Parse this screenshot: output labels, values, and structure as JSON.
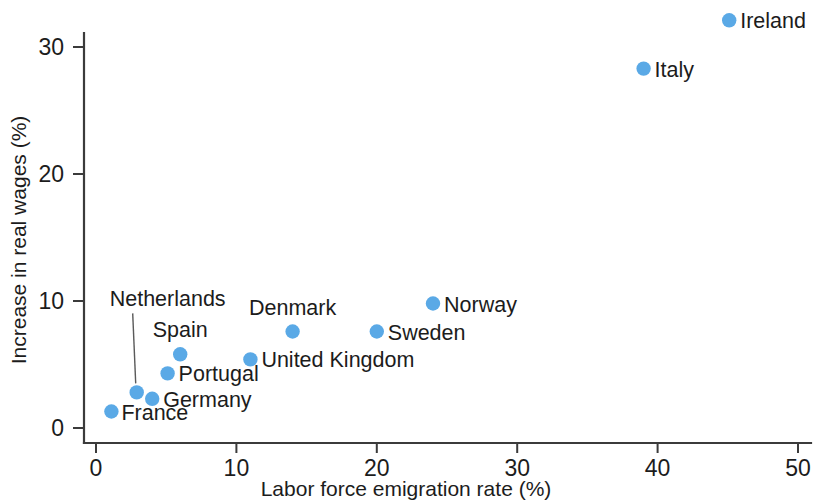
{
  "chart_data": {
    "type": "scatter",
    "title": "",
    "xlabel": "Labor force emigration rate (%)",
    "ylabel": "Increase in real wages (%)",
    "xlim": [
      0,
      50
    ],
    "ylim": [
      0,
      33.7
    ],
    "xticks": [
      0,
      10,
      20,
      30,
      40,
      50
    ],
    "yticks": [
      0,
      10,
      20,
      30
    ],
    "xtick_labels": [
      "0",
      "10",
      "20",
      "30",
      "40",
      "50"
    ],
    "ytick_labels": [
      "0",
      "10",
      "20",
      "30"
    ],
    "grid": false,
    "legend": "none",
    "marker_color": "#5aa9e6",
    "points": [
      {
        "label": "France",
        "x": 1.1,
        "y": 1.3,
        "label_dx": 10,
        "label_dy": 8,
        "anchor": "start",
        "leader": false
      },
      {
        "label": "Netherlands",
        "x": 2.9,
        "y": 2.8,
        "label_dx": -27,
        "label_dy": -86,
        "anchor": "start",
        "leader": true
      },
      {
        "label": "Germany",
        "x": 4.0,
        "y": 2.3,
        "label_dx": 11,
        "label_dy": 8,
        "anchor": "start",
        "leader": false
      },
      {
        "label": "Portugal",
        "x": 5.1,
        "y": 4.3,
        "label_dx": 11,
        "label_dy": 8,
        "anchor": "start",
        "leader": false
      },
      {
        "label": "Spain",
        "x": 6.0,
        "y": 5.8,
        "label_dx": 0,
        "label_dy": -17,
        "anchor": "middle",
        "leader": false
      },
      {
        "label": "United Kingdom",
        "x": 11.0,
        "y": 5.4,
        "label_dx": 11,
        "label_dy": 8,
        "anchor": "start",
        "leader": false
      },
      {
        "label": "Denmark",
        "x": 14.0,
        "y": 7.6,
        "label_dx": 0,
        "label_dy": -17,
        "anchor": "middle",
        "leader": false
      },
      {
        "label": "Sweden",
        "x": 20.0,
        "y": 7.6,
        "label_dx": 11,
        "label_dy": 8,
        "anchor": "start",
        "leader": false
      },
      {
        "label": "Norway",
        "x": 24.0,
        "y": 9.8,
        "label_dx": 11,
        "label_dy": 8,
        "anchor": "start",
        "leader": false
      },
      {
        "label": "Italy",
        "x": 39.0,
        "y": 28.3,
        "label_dx": 11,
        "label_dy": 8,
        "anchor": "start",
        "leader": false
      },
      {
        "label": "Ireland",
        "x": 45.1,
        "y": 32.1,
        "label_dx": 11,
        "label_dy": 8,
        "anchor": "start",
        "leader": false
      }
    ]
  }
}
